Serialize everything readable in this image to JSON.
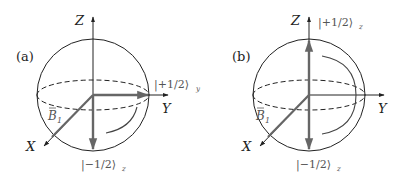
{
  "figure": {
    "panels": [
      {
        "id": "a",
        "label": "(a)",
        "axes": {
          "x": "X",
          "y": "Y",
          "z": "Z"
        },
        "field_label": "B",
        "field_subscript": "1",
        "states": [
          {
            "ket": "|+1/2⟩",
            "basis": "y",
            "position": "Y-axis tip"
          },
          {
            "ket": "|−1/2⟩",
            "basis": "z",
            "position": "bottom of sphere"
          }
        ],
        "rotation": "arc from -Z toward +Y"
      },
      {
        "id": "b",
        "label": "(b)",
        "axes": {
          "x": "X",
          "y": "Y",
          "z": "Z"
        },
        "field_label": "B",
        "field_subscript": "1",
        "states": [
          {
            "ket": "|+1/2⟩",
            "basis": "z",
            "position": "top of sphere"
          },
          {
            "ket": "|−1/2⟩",
            "basis": "z",
            "position": "bottom of sphere"
          }
        ],
        "rotation": "arc from +Z to -Z"
      }
    ],
    "colors": {
      "outline": "#222222",
      "state_vector": "#666666",
      "text": "#222222",
      "ket_text": "#555555"
    }
  }
}
